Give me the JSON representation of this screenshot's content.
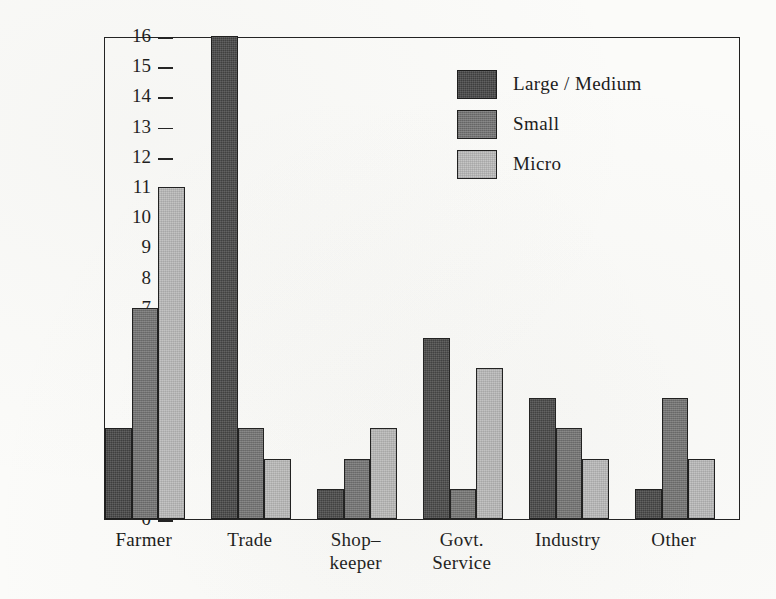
{
  "chart_data": {
    "type": "bar",
    "title": "",
    "subtitle": "",
    "xlabel": "",
    "ylabel": "Number of Respondents",
    "ylim": [
      0,
      16
    ],
    "y_ticks": [
      0,
      1,
      2,
      3,
      4,
      5,
      6,
      7,
      8,
      9,
      10,
      11,
      12,
      13,
      14,
      15,
      16
    ],
    "y_tick_labels": [
      "0",
      "1",
      "2",
      "3",
      "4",
      "5",
      "6",
      "7",
      "8",
      "9",
      "10",
      "11",
      "12",
      "13",
      "14",
      "15",
      "16"
    ],
    "grid": false,
    "legend_position": "upper-right-inside",
    "grouping": "grouped",
    "categories": [
      "Farmer",
      "Trade",
      "Shop–\nkeeper",
      "Govt.\nService",
      "Industry",
      "Other"
    ],
    "category_labels_flat": [
      "Farmer",
      "Trade",
      "Shop–keeper",
      "Govt. Service",
      "Industry",
      "Other"
    ],
    "series": [
      {
        "name": "Large / Medium",
        "color": "#3c3c3c",
        "values": [
          3,
          16,
          1,
          6,
          4,
          1
        ]
      },
      {
        "name": "Small",
        "color": "#717171",
        "values": [
          7,
          3,
          2,
          1,
          3,
          4
        ]
      },
      {
        "name": "Micro",
        "color": "#c6c6c6",
        "values": [
          11,
          2,
          3,
          5,
          2,
          2
        ]
      }
    ]
  },
  "legend": {
    "entries": [
      {
        "label": "Large / Medium",
        "swatch_class": "fill-lm"
      },
      {
        "label": "Small",
        "swatch_class": "fill-small"
      },
      {
        "label": "Micro",
        "swatch_class": "fill-micro"
      }
    ]
  },
  "axes": {
    "y_title": "Number of Respondents"
  }
}
